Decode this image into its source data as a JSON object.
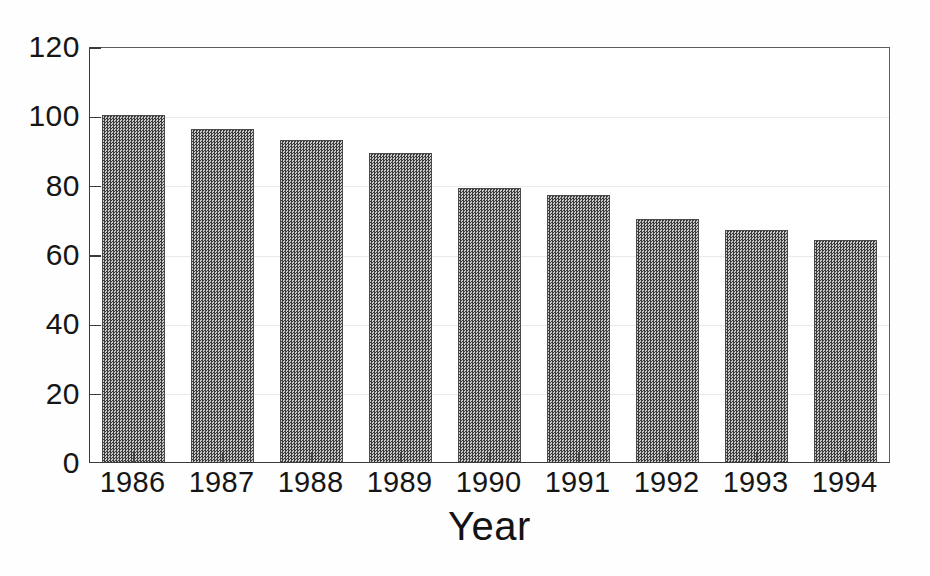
{
  "chart_data": {
    "type": "bar",
    "title": "",
    "xlabel": "Year",
    "ylabel": "",
    "categories": [
      "1986",
      "1987",
      "1988",
      "1989",
      "1990",
      "1991",
      "1992",
      "1993",
      "1994"
    ],
    "values": [
      100,
      96,
      93,
      89,
      79,
      77,
      70,
      67,
      64
    ],
    "ylim": [
      0,
      120
    ],
    "ytick_labels": [
      "0",
      "20",
      "40",
      "60",
      "80",
      "100",
      "120"
    ],
    "ytick_values": [
      0,
      20,
      40,
      60,
      80,
      100,
      120
    ],
    "grid": true,
    "legend": "none",
    "series": [
      {
        "name": "",
        "values": [
          100,
          96,
          93,
          89,
          79,
          77,
          70,
          67,
          64
        ]
      }
    ],
    "bar_fill_color": "#6e6e6e",
    "bar_edge_color": "#4a4a4a",
    "axis_color": "#3a3a3a",
    "background_color": "#ffffff"
  }
}
